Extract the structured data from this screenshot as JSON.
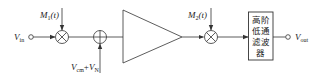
{
  "diagram": {
    "input": {
      "label": "V",
      "sub": "in"
    },
    "modulator1": {
      "label": "M",
      "sub": "1",
      "arg": "(t)"
    },
    "adder_input": {
      "label1": "V",
      "sub1": "cm",
      "plus": "+",
      "label2": "V",
      "sub2": "N"
    },
    "amplifier": {
      "type": "triangle"
    },
    "modulator2": {
      "label": "M",
      "sub": "2",
      "arg": "(t)"
    },
    "filter": {
      "lines": [
        "高阶",
        "低通",
        "滤波",
        "器"
      ]
    },
    "output": {
      "label": "V",
      "sub": "out"
    },
    "colors": {
      "stroke": "#333333",
      "text": "#222222",
      "background": "#ffffff"
    }
  }
}
